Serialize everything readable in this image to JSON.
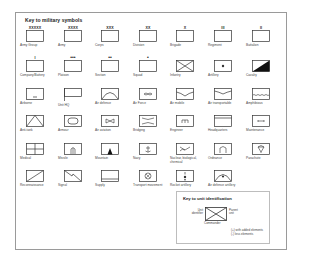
{
  "key": {
    "title": "Key to military symbols",
    "symbols": [
      {
        "label": "Army Group",
        "icon": "army-group-icon",
        "mark": "XXXXX",
        "row": 0,
        "col": 0
      },
      {
        "label": "Army",
        "icon": "army-icon",
        "mark": "XXXX",
        "row": 0,
        "col": 1
      },
      {
        "label": "Corps",
        "icon": "corps-icon",
        "mark": "XXX",
        "row": 0,
        "col": 2
      },
      {
        "label": "Division",
        "icon": "division-icon",
        "mark": "XX",
        "row": 0,
        "col": 3
      },
      {
        "label": "Brigade",
        "icon": "brigade-icon",
        "mark": "X",
        "row": 0,
        "col": 4
      },
      {
        "label": "Regiment",
        "icon": "regiment-icon",
        "mark": "III",
        "row": 0,
        "col": 5
      },
      {
        "label": "Battalion",
        "icon": "battalion-icon",
        "mark": "II",
        "row": 0,
        "col": 6
      },
      {
        "label": "Company/Battery",
        "icon": "company-icon",
        "mark": "I",
        "row": 1,
        "col": 0
      },
      {
        "label": "Platoon",
        "icon": "platoon-icon",
        "mark": "•••",
        "row": 1,
        "col": 1
      },
      {
        "label": "Section",
        "icon": "section-icon",
        "mark": "••",
        "row": 1,
        "col": 2
      },
      {
        "label": "Squad",
        "icon": "squad-icon",
        "mark": "•",
        "row": 1,
        "col": 3
      },
      {
        "label": "Infantry",
        "icon": "infantry-icon",
        "row": 1,
        "col": 4
      },
      {
        "label": "Artillery",
        "icon": "artillery-icon",
        "row": 1,
        "col": 5
      },
      {
        "label": "Cavalry",
        "icon": "cavalry-icon",
        "row": 1,
        "col": 6
      },
      {
        "label": "Airborne",
        "icon": "airborne-icon",
        "row": 2,
        "col": 0
      },
      {
        "label": "Unit HQ",
        "icon": "unit-hq-icon",
        "row": 2,
        "col": 1
      },
      {
        "label": "Air defence",
        "icon": "air-defence-icon",
        "row": 2,
        "col": 2
      },
      {
        "label": "Air Force",
        "icon": "air-force-icon",
        "row": 2,
        "col": 3
      },
      {
        "label": "Air mobile",
        "icon": "air-mobile-icon",
        "row": 2,
        "col": 4
      },
      {
        "label": "Air transportable",
        "icon": "air-transportable-icon",
        "row": 2,
        "col": 5
      },
      {
        "label": "Amphibious",
        "icon": "amphibious-icon",
        "row": 2,
        "col": 6
      },
      {
        "label": "Anti-tank",
        "icon": "anti-tank-icon",
        "row": 3,
        "col": 0
      },
      {
        "label": "Armour",
        "icon": "armour-icon",
        "row": 3,
        "col": 1
      },
      {
        "label": "Air aviation",
        "icon": "air-aviation-icon",
        "row": 3,
        "col": 2
      },
      {
        "label": "Bridging",
        "icon": "bridging-icon",
        "row": 3,
        "col": 3
      },
      {
        "label": "Engineer",
        "icon": "engineer-icon",
        "row": 3,
        "col": 4
      },
      {
        "label": "Headquarters",
        "icon": "headquarters-icon",
        "row": 3,
        "col": 5
      },
      {
        "label": "Maintenance",
        "icon": "maintenance-icon",
        "row": 3,
        "col": 6
      },
      {
        "label": "Medical",
        "icon": "medical-icon",
        "row": 4,
        "col": 0
      },
      {
        "label": "Missile",
        "icon": "missile-icon",
        "row": 4,
        "col": 1
      },
      {
        "label": "Mountain",
        "icon": "mountain-icon",
        "row": 4,
        "col": 2
      },
      {
        "label": "Navy",
        "icon": "navy-icon",
        "row": 4,
        "col": 3
      },
      {
        "label": "Nuclear, biological, chemical",
        "icon": "nbc-icon",
        "row": 4,
        "col": 4
      },
      {
        "label": "Ordnance",
        "icon": "ordnance-icon",
        "row": 4,
        "col": 5
      },
      {
        "label": "Parachute",
        "icon": "parachute-icon",
        "row": 4,
        "col": 6
      },
      {
        "label": "Reconnaissance",
        "icon": "reconnaissance-icon",
        "row": 5,
        "col": 0
      },
      {
        "label": "Signal",
        "icon": "signal-icon",
        "row": 5,
        "col": 1
      },
      {
        "label": "Supply",
        "icon": "supply-icon",
        "row": 5,
        "col": 2
      },
      {
        "label": "Transport movement",
        "icon": "transport-movement-icon",
        "row": 5,
        "col": 3
      },
      {
        "label": "Rocket artillery",
        "icon": "rocket-artillery-icon",
        "row": 5,
        "col": 4
      },
      {
        "label": "Air defence artillery",
        "icon": "air-defence-artillery-icon",
        "row": 5,
        "col": 5
      }
    ]
  },
  "unit_key": {
    "title": "Key to unit identification",
    "unit_identifier": "Unit identifier",
    "parent_unit": "Parent unit",
    "commander": "Commander",
    "note_added": "(+) with added elements",
    "note_less": "(-) less elements"
  }
}
